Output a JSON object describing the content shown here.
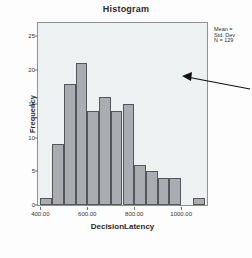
{
  "chart_data": {
    "type": "bar",
    "title": "Histogram",
    "xlabel": "DecisionLatency",
    "ylabel": "Frequency",
    "categories": [
      "400-450",
      "450-500",
      "500-550",
      "550-600",
      "600-650",
      "650-700",
      "700-750",
      "750-800",
      "800-850",
      "850-900",
      "900-950",
      "950-1000",
      "1000-1050",
      "1050-1100"
    ],
    "values": [
      1,
      9,
      18,
      21,
      14,
      16,
      14,
      15,
      6,
      5,
      4,
      4,
      0,
      1
    ],
    "bin_starts": [
      400,
      450,
      500,
      550,
      600,
      650,
      700,
      750,
      800,
      850,
      900,
      950,
      1000,
      1050
    ],
    "bin_width": 50,
    "xlim": [
      390,
      1110
    ],
    "ylim": [
      0,
      27
    ],
    "xticks": [
      "400.00",
      "600.00",
      "800.00",
      "1000.00"
    ],
    "xtick_values": [
      400,
      600,
      800,
      1000
    ],
    "yticks": [
      "0",
      "5",
      "10",
      "15",
      "20",
      "25"
    ],
    "ytick_values": [
      0,
      5,
      10,
      15,
      20,
      25
    ],
    "grid": false,
    "legend": "none",
    "bar_color": "#a9adb1",
    "bar_edge_color": "#53575b",
    "plot_background": "#eef1f2"
  },
  "stats": {
    "line1": "Mean = ",
    "line2": "Std. Dev",
    "line3": "N = 129"
  },
  "annotation": {
    "name": "pointer-arrow"
  }
}
